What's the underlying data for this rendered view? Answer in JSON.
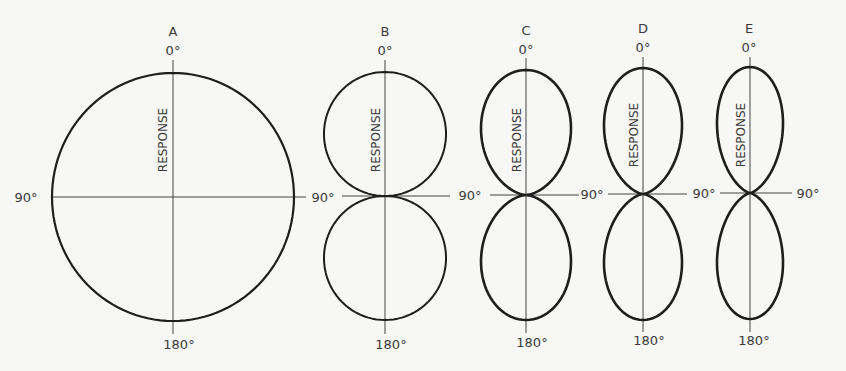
{
  "figure": {
    "background": "#f7f7f5",
    "line_color": "#1e1e1e",
    "axis_color": "#444444",
    "text_color": "#3a3a3a",
    "diagrams": [
      {
        "id": "A",
        "label": "A",
        "pattern": "omnidirectional",
        "response_label": "RESPONSE",
        "top_label": "0°",
        "bottom_label": "180°",
        "left_label": "90°",
        "right_label": "",
        "cx": 173,
        "cy": 197,
        "rx": 121,
        "ry": 124,
        "stroke_width": 2.2,
        "axis": {
          "top": 60,
          "bottom": 334,
          "left": 52,
          "right": 306
        },
        "letter_pos": [
          173,
          36
        ],
        "top_pos": [
          173,
          55
        ],
        "bottom_pos": [
          179,
          349
        ],
        "left_pos": [
          26,
          202
        ],
        "right_pos": null,
        "response_pos": [
          163,
          140
        ]
      },
      {
        "id": "B",
        "label": "B",
        "pattern": "figure-eight (cos)",
        "response_label": "RESPONSE",
        "top_label": "0°",
        "bottom_label": "180°",
        "left_label": "90°",
        "right_label": "",
        "cx": 385,
        "cy": 196,
        "rx": 61,
        "ry": 124,
        "k": 1.0,
        "stroke_width": 2.0,
        "axis": {
          "top": 60,
          "bottom": 334,
          "left": 342,
          "right": 450
        },
        "letter_pos": [
          385,
          36
        ],
        "top_pos": [
          385,
          55
        ],
        "bottom_pos": [
          391,
          349
        ],
        "left_pos": [
          323,
          202
        ],
        "right_pos": null,
        "response_pos": [
          376,
          140
        ]
      },
      {
        "id": "C",
        "label": "C",
        "pattern": "narrowed figure-eight",
        "response_label": "RESPONSE",
        "top_label": "0°",
        "bottom_label": "180°",
        "left_label": "90°",
        "right_label": "",
        "cx": 526,
        "cy": 195,
        "rx": 45,
        "ry": 125,
        "k": 1.6,
        "stroke_width": 2.6,
        "axis": {
          "top": 58,
          "bottom": 333,
          "left": 490,
          "right": 579
        },
        "letter_pos": [
          526,
          35
        ],
        "top_pos": [
          526,
          54
        ],
        "bottom_pos": [
          532,
          347
        ],
        "left_pos": [
          470,
          200
        ],
        "right_pos": null,
        "response_pos": [
          517,
          140
        ]
      },
      {
        "id": "D",
        "label": "D",
        "pattern": "narrower figure-eight",
        "response_label": "RESPONSE",
        "top_label": "0°",
        "bottom_label": "180°",
        "left_label": "90°",
        "right_label": "",
        "cx": 643,
        "cy": 194,
        "rx": 39,
        "ry": 126,
        "k": 2.0,
        "stroke_width": 2.6,
        "axis": {
          "top": 57,
          "bottom": 332,
          "left": 608,
          "right": 687
        },
        "letter_pos": [
          643,
          33
        ],
        "top_pos": [
          643,
          52
        ],
        "bottom_pos": [
          649,
          345
        ],
        "left_pos": [
          592,
          199
        ],
        "right_pos": null,
        "response_pos": [
          634,
          135
        ]
      },
      {
        "id": "E",
        "label": "E",
        "pattern": "narrowest figure-eight",
        "response_label": "RESPONSE",
        "top_label": "0°",
        "bottom_label": "180°",
        "left_label": "90°",
        "right_label": "90°",
        "cx": 750,
        "cy": 193,
        "rx": 33,
        "ry": 126,
        "k": 2.4,
        "stroke_width": 2.6,
        "axis": {
          "top": 57,
          "bottom": 332,
          "left": 720,
          "right": 792
        },
        "letter_pos": [
          749,
          33
        ],
        "top_pos": [
          749,
          52
        ],
        "bottom_pos": [
          754,
          345
        ],
        "left_pos": [
          704,
          198
        ],
        "right_pos": [
          808,
          198
        ],
        "response_pos": [
          741,
          135
        ]
      }
    ]
  }
}
